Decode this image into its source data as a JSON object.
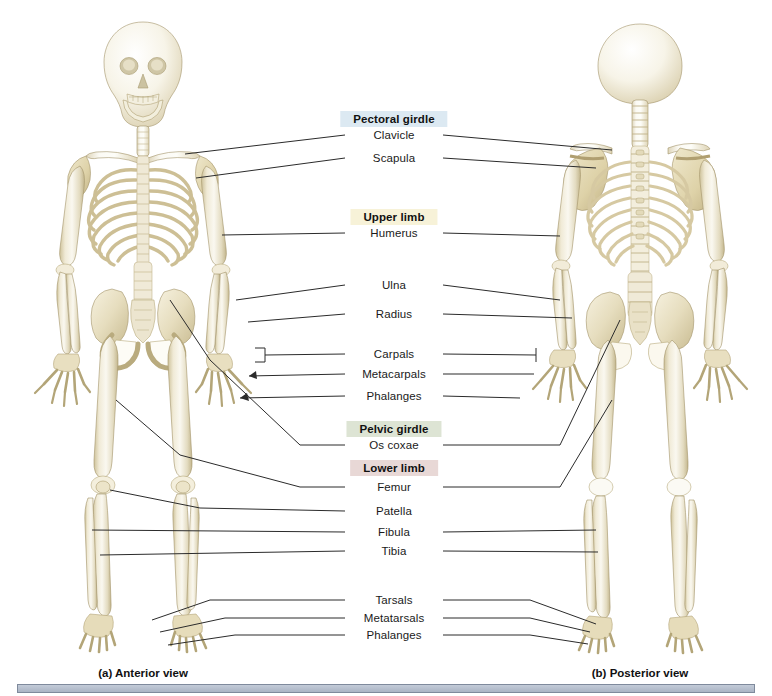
{
  "figure": {
    "background_color": "#ffffff"
  },
  "headers": [
    {
      "id": "pectoral-girdle",
      "label": "Pectoral girdle",
      "color": "#dce9f2",
      "x": 394,
      "y": 119
    },
    {
      "id": "upper-limb",
      "label": "Upper limb",
      "color": "#f7f2d8",
      "x": 394,
      "y": 217
    },
    {
      "id": "pelvic-girdle",
      "label": "Pelvic girdle",
      "color": "#dde4d4",
      "x": 394,
      "y": 429
    },
    {
      "id": "lower-limb",
      "label": "Lower limb",
      "color": "#e8d8d6",
      "x": 394,
      "y": 468
    }
  ],
  "labels": [
    {
      "id": "clavicle",
      "text": "Clavicle",
      "x": 394,
      "y": 135,
      "group": "pectoral-girdle"
    },
    {
      "id": "scapula",
      "text": "Scapula",
      "x": 394,
      "y": 158,
      "group": "pectoral-girdle"
    },
    {
      "id": "humerus",
      "text": "Humerus",
      "x": 394,
      "y": 233,
      "group": "upper-limb"
    },
    {
      "id": "ulna",
      "text": "Ulna",
      "x": 394,
      "y": 285,
      "group": "upper-limb"
    },
    {
      "id": "radius",
      "text": "Radius",
      "x": 394,
      "y": 314,
      "group": "upper-limb"
    },
    {
      "id": "carpals",
      "text": "Carpals",
      "x": 394,
      "y": 354,
      "group": "upper-limb"
    },
    {
      "id": "metacarpals",
      "text": "Metacarpals",
      "x": 394,
      "y": 374,
      "group": "upper-limb"
    },
    {
      "id": "phalanges-hand",
      "text": "Phalanges",
      "x": 394,
      "y": 396,
      "group": "upper-limb"
    },
    {
      "id": "os-coxae",
      "text": "Os coxae",
      "x": 394,
      "y": 445,
      "group": "pelvic-girdle"
    },
    {
      "id": "femur",
      "text": "Femur",
      "x": 394,
      "y": 487,
      "group": "lower-limb"
    },
    {
      "id": "patella",
      "text": "Patella",
      "x": 394,
      "y": 511,
      "group": "lower-limb"
    },
    {
      "id": "fibula",
      "text": "Fibula",
      "x": 394,
      "y": 532,
      "group": "lower-limb"
    },
    {
      "id": "tibia",
      "text": "Tibia",
      "x": 394,
      "y": 551,
      "group": "lower-limb"
    },
    {
      "id": "tarsals",
      "text": "Tarsals",
      "x": 394,
      "y": 600,
      "group": "lower-limb"
    },
    {
      "id": "metatarsals",
      "text": "Metatarsals",
      "x": 394,
      "y": 618,
      "group": "lower-limb"
    },
    {
      "id": "phalanges-foot",
      "text": "Phalanges",
      "x": 394,
      "y": 635,
      "group": "lower-limb"
    }
  ],
  "captions": [
    {
      "id": "anterior",
      "text": "(a) Anterior view",
      "x": 143,
      "y": 673
    },
    {
      "id": "posterior",
      "text": "(b) Posterior view",
      "x": 640,
      "y": 673
    }
  ],
  "bottom_bar": {
    "color": "#b6bfcd",
    "border_color": "#7f8a9c"
  },
  "bone_palette": {
    "light": "#f8f6ee",
    "mid": "#e6dfc6",
    "shade": "#cfc49e",
    "deep": "#b9ab7e",
    "outline": "#9c8e63"
  }
}
